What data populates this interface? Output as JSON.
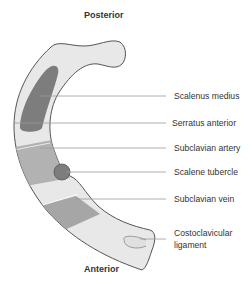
{
  "headings": {
    "top": "Posterior",
    "bottom": "Anterior"
  },
  "labels": [
    {
      "text": "Scalenus medius",
      "y": 96
    },
    {
      "text": "Serratus anterior",
      "y": 123
    },
    {
      "text": "Subclavian artery",
      "y": 148
    },
    {
      "text": "Scalene tubercle",
      "y": 172
    },
    {
      "text": "Subclavian vein",
      "y": 199
    },
    {
      "text": "Costoclavicular",
      "y": 233
    },
    {
      "text": "ligament",
      "y": 245
    }
  ],
  "colors": {
    "bone": "#e8e8e8",
    "outline": "#555555",
    "muscle": "#7d7d7d",
    "vessel": "#b9b9b9",
    "leader": "#9a9a9a",
    "text": "#333333"
  }
}
